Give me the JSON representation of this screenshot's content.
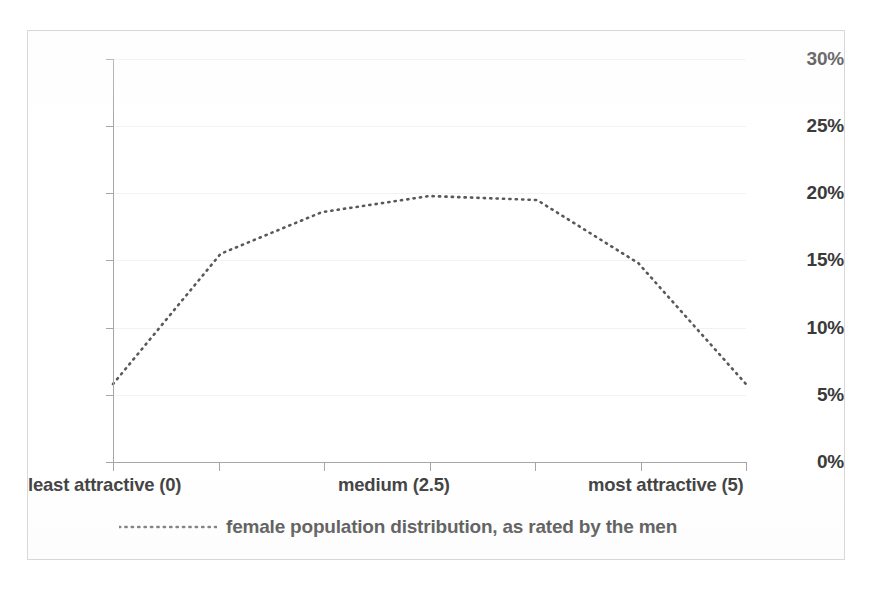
{
  "chart_data": {
    "type": "line",
    "title": "",
    "xlabel": "",
    "ylabel": "",
    "xlim": [
      0,
      5
    ],
    "ylim": [
      0,
      0.3
    ],
    "grid": true,
    "legend_position": "bottom-left",
    "x_tick_labels": [
      "least attractive (0)",
      "medium (2.5)",
      "most attractive (5)"
    ],
    "y_tick_labels": [
      "0%",
      "5%",
      "10%",
      "15%",
      "20%",
      "25%",
      "30%"
    ],
    "y_ticks": [
      0,
      5,
      10,
      15,
      20,
      25,
      30
    ],
    "x": [
      0.0,
      0.85,
      1.65,
      2.5,
      3.35,
      4.15,
      5.0
    ],
    "series": [
      {
        "name": "female population distribution, as rated by the men",
        "line_style": "dotted",
        "color": "#595959",
        "values": [
          5.8,
          15.5,
          18.6,
          19.8,
          19.5,
          14.8,
          5.8
        ]
      }
    ]
  },
  "axis": {
    "y_labels": [
      "30%",
      "25%",
      "20%",
      "15%",
      "10%",
      "5%",
      "0%"
    ],
    "x_labels": {
      "left": "least attractive (0)",
      "middle": "medium (2.5)",
      "right": "most attractive (5)"
    }
  },
  "legend": {
    "entries": [
      {
        "label": "female population distribution, as rated by the men",
        "marker": "dotted-line-swatch"
      }
    ]
  },
  "style": {
    "axis_color": "#a6a6a6",
    "grid_color": "#f2f2f2",
    "series_color": "#595959",
    "text_color": "#333333",
    "border_color": "#d8d8d8",
    "background": "#ffffff"
  }
}
